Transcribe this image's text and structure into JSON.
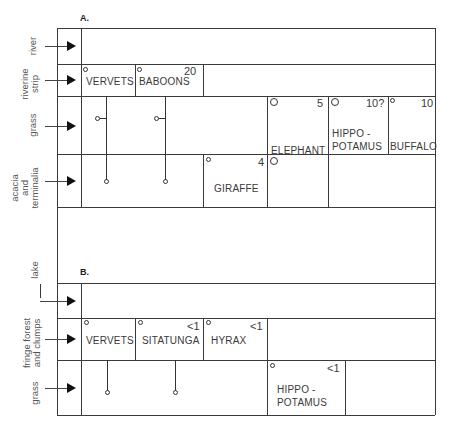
{
  "panels": [
    {
      "label": "A.",
      "zones": [
        {
          "label": "river"
        },
        {
          "label": "riverine strip",
          "lines": [
            "riverine",
            "strip"
          ]
        },
        {
          "label": "grass"
        },
        {
          "label": "acacia and terminalia",
          "lines": [
            "acacia",
            "and",
            "terminalia"
          ]
        }
      ],
      "animals": [
        {
          "name": "VERVETS",
          "zone": "riverine strip",
          "count": ""
        },
        {
          "name": "BABOONS",
          "zone": "riverine strip",
          "count": "20"
        },
        {
          "name": "ELEPHANT",
          "zone": "grass; acacia and terminalia",
          "count": "5"
        },
        {
          "name": "HIPPO - POTAMUS",
          "lines": [
            "HIPPO -",
            "POTAMUS"
          ],
          "zone": "grass",
          "count": "10?"
        },
        {
          "name": "BUFFALO",
          "zone": "grass",
          "count": "10"
        },
        {
          "name": "GIRAFFE",
          "zone": "acacia and terminalia",
          "count": "4"
        }
      ]
    },
    {
      "label": "B.",
      "zones": [
        {
          "label": "lake"
        },
        {
          "label": "fringe forest and clumps",
          "lines": [
            "fringe forest",
            "and clumps"
          ]
        },
        {
          "label": "grass"
        }
      ],
      "animals": [
        {
          "name": "VERVETS",
          "zone": "fringe forest and clumps",
          "count": ""
        },
        {
          "name": "SITATUNGA",
          "zone": "fringe forest and clumps",
          "count": "<1"
        },
        {
          "name": "HYRAX",
          "zone": "fringe forest and clumps",
          "count": "<1"
        },
        {
          "name": "HIPPO - POTAMUS",
          "lines": [
            "HIPPO -",
            "POTAMUS"
          ],
          "zone": "grass",
          "count": "<1"
        }
      ]
    }
  ]
}
